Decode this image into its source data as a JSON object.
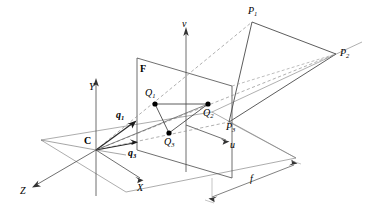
{
  "figure": {
    "caption_title": "Perspective projection of a 3D triangle onto the image plane",
    "background_color": "#ffffff",
    "line_color": "#3c3c3c",
    "dash_color": "#7a7a7a",
    "point_color": "#000000",
    "width": 369,
    "height": 213
  },
  "labels": {
    "camera_center": "C",
    "image_plane": "F",
    "axis_x": "X",
    "axis_y": "Y",
    "axis_z": "Z",
    "axis_u": "u",
    "axis_v": "v",
    "focal_length": "f",
    "vector_q1": "q",
    "vector_q1_sub": "1",
    "vector_q3": "q",
    "vector_q3_sub": "3",
    "image_point_1": "Q",
    "image_point_1_sub": "1",
    "image_point_2": "Q",
    "image_point_2_sub": "2",
    "image_point_3": "Q",
    "image_point_3_sub": "3",
    "world_point_1": "P",
    "world_point_1_sub": "1",
    "world_point_2": "P",
    "world_point_2_sub": "2",
    "world_point_3": "P",
    "world_point_3_sub": "3"
  },
  "geometry": {
    "camera_center": {
      "x": 96,
      "y": 150
    },
    "image_plane_corners": [
      {
        "x": 137,
        "y": 58
      },
      {
        "x": 232,
        "y": 86
      },
      {
        "x": 232,
        "y": 178
      },
      {
        "x": 137,
        "y": 150
      }
    ],
    "ground_plane_corners": [
      {
        "x": 41,
        "y": 140
      },
      {
        "x": 212,
        "y": 112
      },
      {
        "x": 296,
        "y": 158
      },
      {
        "x": 126,
        "y": 192
      }
    ],
    "image_points": [
      {
        "name": "Q1",
        "x": 155,
        "y": 104
      },
      {
        "name": "Q2",
        "x": 208,
        "y": 104
      },
      {
        "name": "Q3",
        "x": 169,
        "y": 133
      }
    ],
    "world_points": [
      {
        "name": "P1",
        "x": 252,
        "y": 22
      },
      {
        "name": "P2",
        "x": 336,
        "y": 54
      },
      {
        "name": "P3",
        "x": 229,
        "y": 122
      }
    ],
    "axis_y_tip": {
      "x": 96,
      "y": 80
    },
    "axis_z_tip": {
      "x": 34,
      "y": 186
    },
    "axis_x_tip": {
      "x": 141,
      "y": 180
    },
    "axis_v_tip": {
      "x": 186,
      "y": 28
    },
    "axis_u_tip": {
      "x": 228,
      "y": 142
    },
    "focal_line": {
      "x1": 212,
      "y1": 197,
      "x2": 294,
      "y2": 165
    }
  }
}
